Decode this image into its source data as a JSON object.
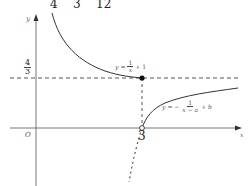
{
  "top_row": {
    "values": [
      "4",
      "3",
      "12"
    ]
  },
  "axes": {
    "x_label": "x",
    "y_label": "y",
    "origin_label": "O"
  },
  "ticks": {
    "y_tick_num": "4",
    "y_tick_den": "3",
    "x_tick": "3"
  },
  "curves": {
    "upper": {
      "lhs": "y",
      "eq": "=",
      "num": "1",
      "den": "x",
      "rest": "+ 1"
    },
    "lower": {
      "lhs": "y",
      "eq": "= −",
      "num": "1",
      "den": "x − a",
      "rest": "+ b"
    }
  },
  "colors": {
    "stroke": "#333333",
    "axis": "#555555",
    "dash": "#444444"
  }
}
